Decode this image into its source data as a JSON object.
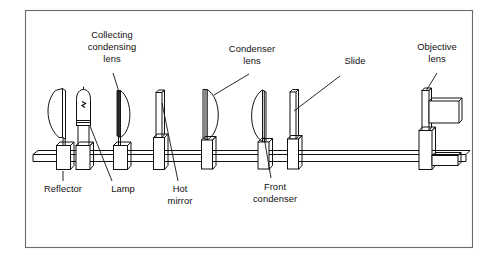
{
  "figure": {
    "kind": "optical-system-schematic",
    "title": "",
    "background_color": "#ffffff",
    "line_color": "#111111",
    "frame_color": "#6b6b6b"
  },
  "labels": {
    "reflector": "Reflector",
    "lamp": "Lamp",
    "collecting_condensing_lens_line1": "Collecting",
    "collecting_condensing_lens_line2": "condensing",
    "collecting_condensing_lens_line3": "lens",
    "hot_mirror_line1": "Hot",
    "hot_mirror_line2": "mirror",
    "condenser_lens_line1": "Condenser",
    "condenser_lens_line2": "lens",
    "front_condenser_line1": "Front",
    "front_condenser_line2": "condenser",
    "slide": "Slide",
    "objective_lens_line1": "Objective",
    "objective_lens_line2": "lens"
  },
  "components": [
    {
      "id": "reflector",
      "name": "Reflector",
      "shape": "concave-mirror",
      "x": 57
    },
    {
      "id": "lamp",
      "name": "Lamp",
      "shape": "bulb-with-filament",
      "x": 82
    },
    {
      "id": "collecting-condensing-lens",
      "name": "Collecting condensing lens",
      "shape": "plano-convex-lens",
      "x": 118
    },
    {
      "id": "hot-mirror",
      "name": "Hot mirror",
      "shape": "flat-plate",
      "x": 158
    },
    {
      "id": "condenser-lens",
      "name": "Condenser lens",
      "shape": "plano-convex-lens",
      "x": 207
    },
    {
      "id": "front-condenser",
      "name": "Front condenser",
      "shape": "convex-plano-lens",
      "x": 255
    },
    {
      "id": "slide",
      "name": "Slide",
      "shape": "flat-plate",
      "x": 292
    },
    {
      "id": "objective-lens",
      "name": "Objective lens",
      "shape": "barrel-assembly",
      "x": 424
    }
  ]
}
